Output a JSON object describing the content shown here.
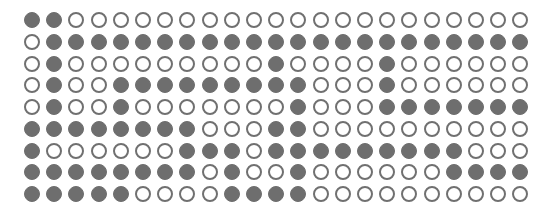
{
  "grid": {
    "rows": 9,
    "cols": 23,
    "colors": {
      "filled": "#6e6e6e",
      "outline": "#707070",
      "background": "#ffffff"
    },
    "legend": {
      "filled_symbol": "●",
      "empty_symbol": "○"
    },
    "pattern": [
      "●●○○○○○○○○○○○○○○○○○○○○○",
      "○●●●●●●●●●●●●●●●●●●●●●●",
      "○●○○○○○○○○○●○○○○●○○○○○○",
      "○●○○●●●●●●●●●○○○●○○○○○○",
      "○●○○●○○○○○○○●○○○●●●●●●●",
      "●●●●●●●●○○○●●○○○○○○○○○○",
      "●○○○○○○●●●○●●●●●●●●●○○○",
      "●●●●●●●●○●○○●○○○○○○●●●●",
      "●●●●●○○○○●●●●○○○○○○○○○○"
    ]
  }
}
